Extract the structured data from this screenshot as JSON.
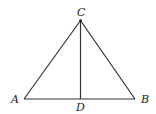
{
  "diagram": {
    "type": "geometry-triangle",
    "points": {
      "A": {
        "label": "A",
        "x": 24,
        "y": 99
      },
      "B": {
        "label": "B",
        "x": 135,
        "y": 99
      },
      "C": {
        "label": "C",
        "x": 80.5,
        "y": 20.5
      },
      "D": {
        "label": "D",
        "x": 80.5,
        "y": 99
      }
    },
    "segments": [
      {
        "from": "A",
        "to": "B"
      },
      {
        "from": "A",
        "to": "C"
      },
      {
        "from": "B",
        "to": "C"
      },
      {
        "from": "C",
        "to": "D"
      }
    ],
    "labels": {
      "A": "A",
      "B": "B",
      "C": "C",
      "D": "D"
    },
    "colors": {
      "line": "#333333",
      "text": "#222222",
      "background": "#ffffff"
    }
  }
}
